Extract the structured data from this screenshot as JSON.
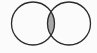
{
  "diagram": {
    "type": "venn",
    "sets": [
      {
        "name": "A",
        "cx": 33,
        "cy": 23.5,
        "r": 21.5
      },
      {
        "name": "B",
        "cx": 69,
        "cy": 23.5,
        "r": 21.5
      }
    ],
    "shaded_region": "intersection",
    "colors": {
      "background": "#fbfbfb",
      "outline": "#2a2a2a",
      "fill_shaded": "#a8a8a8",
      "fill_unshaded": "#fbfbfb"
    },
    "stroke_width": 1.3
  }
}
